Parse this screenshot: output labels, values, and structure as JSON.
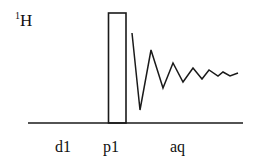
{
  "diagram": {
    "type": "nmr-pulse-sequence",
    "channel": {
      "isotope_mass": "1",
      "element": "H"
    },
    "segments": [
      {
        "id": "d1",
        "label": "d1",
        "kind": "delay"
      },
      {
        "id": "p1",
        "label": "p1",
        "kind": "pulse"
      },
      {
        "id": "aq",
        "label": "aq",
        "kind": "acquisition"
      }
    ],
    "colors": {
      "stroke": "#1a1a1a",
      "text": "#111111",
      "background": "#ffffff"
    }
  }
}
